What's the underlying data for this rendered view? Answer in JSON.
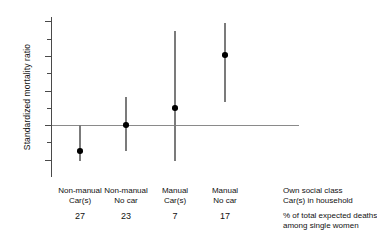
{
  "chart_data": {
    "type": "scatter",
    "title": "",
    "subtitle": "",
    "xlabel": "",
    "ylabel": "Standardized mortality ratio",
    "ylim": [
      40,
      225
    ],
    "yticks": [
      60,
      100,
      140,
      180,
      220
    ],
    "ytick_labels": [
      "60",
      "100",
      "140",
      "180",
      "220"
    ],
    "minor_yticks": [
      80,
      120,
      160,
      200
    ],
    "grid": false,
    "legend": "none",
    "reference_line": {
      "value": 100,
      "orientation": "horizontal",
      "label": ""
    },
    "categories": [
      "Non-manual Car(s)",
      "Non-manual No car",
      "Manual Car(s)",
      "Manual No car"
    ],
    "category_lines": [
      [
        "Non-manual",
        "Car(s)"
      ],
      [
        "Non-manual",
        "No car"
      ],
      [
        "Manual",
        "Car(s)"
      ],
      [
        "Manual",
        "No car"
      ]
    ],
    "values": [
      70,
      100,
      120,
      181
    ],
    "ci_lower": [
      59,
      70,
      59,
      127
    ],
    "ci_upper": [
      100,
      133,
      209,
      218
    ],
    "annotations": {
      "row_header_lines": [
        "Own social class",
        "Car(s) in household"
      ],
      "note_lines": [
        "% of total expected deaths",
        "among single women"
      ]
    },
    "secondary_row": {
      "label_lines": [
        "% of total expected deaths",
        "among single women"
      ],
      "values": [
        "27",
        "23",
        "7",
        "17"
      ]
    },
    "colors": {
      "marker": "#000000",
      "ci_bar": "#7b7b7b",
      "axis": "#4a4a4a",
      "reference_line": "#8a8a8a",
      "background": "#ffffff",
      "text": "#111111"
    }
  }
}
